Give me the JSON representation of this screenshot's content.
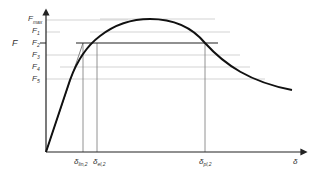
{
  "diagram": {
    "y_axis": {
      "symbol": "F",
      "ticks": [
        {
          "main": "F",
          "sub": "max",
          "y": 20
        },
        {
          "main": "F",
          "sub": "1",
          "y": 32
        },
        {
          "main": "F",
          "sub": "2",
          "y": 43
        },
        {
          "main": "F",
          "sub": "3",
          "y": 55
        },
        {
          "main": "F",
          "sub": "4",
          "y": 67
        },
        {
          "main": "F",
          "sub": "5",
          "y": 79
        }
      ]
    },
    "x_axis": {
      "symbol": "δ",
      "ticks": [
        {
          "main": "δ",
          "sub": "lin,2",
          "x": 83
        },
        {
          "main": "δ",
          "sub": "el,2",
          "x": 97
        },
        {
          "main": "δ",
          "sub": "pl,2",
          "x": 205
        }
      ]
    },
    "colors": {
      "curve": "#111111",
      "axis": "#222222",
      "gridline": "#bbbbbb",
      "drop_line": "#666666"
    }
  }
}
